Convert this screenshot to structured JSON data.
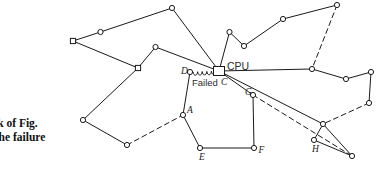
{
  "figure": {
    "caption_lines": [
      "work of Fig.",
      "ter the failure"
    ],
    "colors": {
      "background": "#ffffff",
      "link": "#1a1a1a",
      "node_stroke": "#1a1a1a",
      "node_fill": "#ffffff",
      "label": "#1a1a1a",
      "caption": "#111111"
    },
    "labels": {
      "cpu": "CPU",
      "failed": "Failed",
      "node_a": "A",
      "node_c": "C",
      "node_d": "D",
      "node_e": "E",
      "node_f": "F",
      "node_g": "G",
      "node_h": "H"
    },
    "cpu_box": {
      "x": 213.5,
      "y": 66.5,
      "w": 11,
      "h": 9
    },
    "nodes": [
      {
        "id": "n1",
        "x": 73,
        "y": 41,
        "label": "",
        "shape": "square"
      },
      {
        "id": "n2",
        "x": 100.5,
        "y": 32,
        "label": "",
        "shape": "circle"
      },
      {
        "id": "n3",
        "x": 172,
        "y": 8,
        "label": "",
        "shape": "circle"
      },
      {
        "id": "n4",
        "x": 138,
        "y": 68,
        "label": "",
        "shape": "square"
      },
      {
        "id": "n5",
        "x": 155.5,
        "y": 47,
        "label": "",
        "shape": "circle"
      },
      {
        "id": "n6",
        "x": 83,
        "y": 120,
        "label": "",
        "shape": "circle"
      },
      {
        "id": "n7",
        "x": 127,
        "y": 145,
        "label": "",
        "shape": "circle"
      },
      {
        "id": "D",
        "x": 190,
        "y": 72,
        "label": "D",
        "shape": "circle"
      },
      {
        "id": "A",
        "x": 183,
        "y": 115,
        "label": "A",
        "shape": "circle"
      },
      {
        "id": "E",
        "x": 200,
        "y": 148,
        "label": "E",
        "shape": "circle"
      },
      {
        "id": "F",
        "x": 254,
        "y": 148,
        "label": "F",
        "shape": "circle"
      },
      {
        "id": "G",
        "x": 253,
        "y": 95,
        "label": "G",
        "shape": "circle"
      },
      {
        "id": "C",
        "x": 219,
        "y": 71,
        "label": "C",
        "shape": "none"
      },
      {
        "id": "n8",
        "x": 229.5,
        "y": 32,
        "label": "",
        "shape": "circle"
      },
      {
        "id": "n9",
        "x": 244,
        "y": 46,
        "label": "",
        "shape": "circle"
      },
      {
        "id": "n10",
        "x": 283,
        "y": 19,
        "label": "",
        "shape": "circle"
      },
      {
        "id": "n11",
        "x": 337,
        "y": 5,
        "label": "",
        "shape": "circle"
      },
      {
        "id": "n12",
        "x": 312,
        "y": 69,
        "label": "",
        "shape": "circle"
      },
      {
        "id": "n13",
        "x": 346,
        "y": 79,
        "label": "",
        "shape": "circle"
      },
      {
        "id": "n14",
        "x": 371,
        "y": 72,
        "label": "",
        "shape": "circle"
      },
      {
        "id": "n15",
        "x": 369,
        "y": 103,
        "label": "",
        "shape": "circle"
      },
      {
        "id": "n16",
        "x": 323,
        "y": 124,
        "label": "",
        "shape": "circle"
      },
      {
        "id": "H",
        "x": 314,
        "y": 140,
        "label": "H",
        "shape": "circle"
      },
      {
        "id": "n17",
        "x": 352,
        "y": 156,
        "label": "",
        "shape": "circle"
      }
    ],
    "links": [
      {
        "from": "n1",
        "to": "n2",
        "style": "solid"
      },
      {
        "from": "n2",
        "to": "n3",
        "style": "solid"
      },
      {
        "from": "n3",
        "to": "C",
        "style": "solid"
      },
      {
        "from": "n1",
        "to": "n4",
        "style": "solid"
      },
      {
        "from": "n4",
        "to": "n5",
        "style": "solid"
      },
      {
        "from": "n5",
        "to": "C",
        "style": "solid"
      },
      {
        "from": "n4",
        "to": "n6",
        "style": "solid"
      },
      {
        "from": "n6",
        "to": "n7",
        "style": "solid"
      },
      {
        "from": "n7",
        "to": "A",
        "style": "dashed"
      },
      {
        "from": "D",
        "to": "C",
        "style": "failed"
      },
      {
        "from": "D",
        "to": "A",
        "style": "solid"
      },
      {
        "from": "A",
        "to": "E",
        "style": "solid"
      },
      {
        "from": "E",
        "to": "F",
        "style": "solid"
      },
      {
        "from": "F",
        "to": "G",
        "style": "solid"
      },
      {
        "from": "G",
        "to": "C",
        "style": "solid"
      },
      {
        "from": "C",
        "to": "n8",
        "style": "solid"
      },
      {
        "from": "n8",
        "to": "n9",
        "style": "solid"
      },
      {
        "from": "n9",
        "to": "n10",
        "style": "solid"
      },
      {
        "from": "n10",
        "to": "n11",
        "style": "solid"
      },
      {
        "from": "n11",
        "to": "n12",
        "style": "dashed"
      },
      {
        "from": "C",
        "to": "n12",
        "style": "solid"
      },
      {
        "from": "n12",
        "to": "n13",
        "style": "solid"
      },
      {
        "from": "n13",
        "to": "n14",
        "style": "solid"
      },
      {
        "from": "n14",
        "to": "n15",
        "style": "solid"
      },
      {
        "from": "n15",
        "to": "n16",
        "style": "dashed"
      },
      {
        "from": "n16",
        "to": "n17",
        "style": "solid"
      },
      {
        "from": "C",
        "to": "n16",
        "style": "solid"
      },
      {
        "from": "n16",
        "to": "H",
        "style": "solid"
      },
      {
        "from": "H",
        "to": "n17",
        "style": "solid"
      },
      {
        "from": "G",
        "to": "n17",
        "style": "dashed"
      }
    ]
  }
}
